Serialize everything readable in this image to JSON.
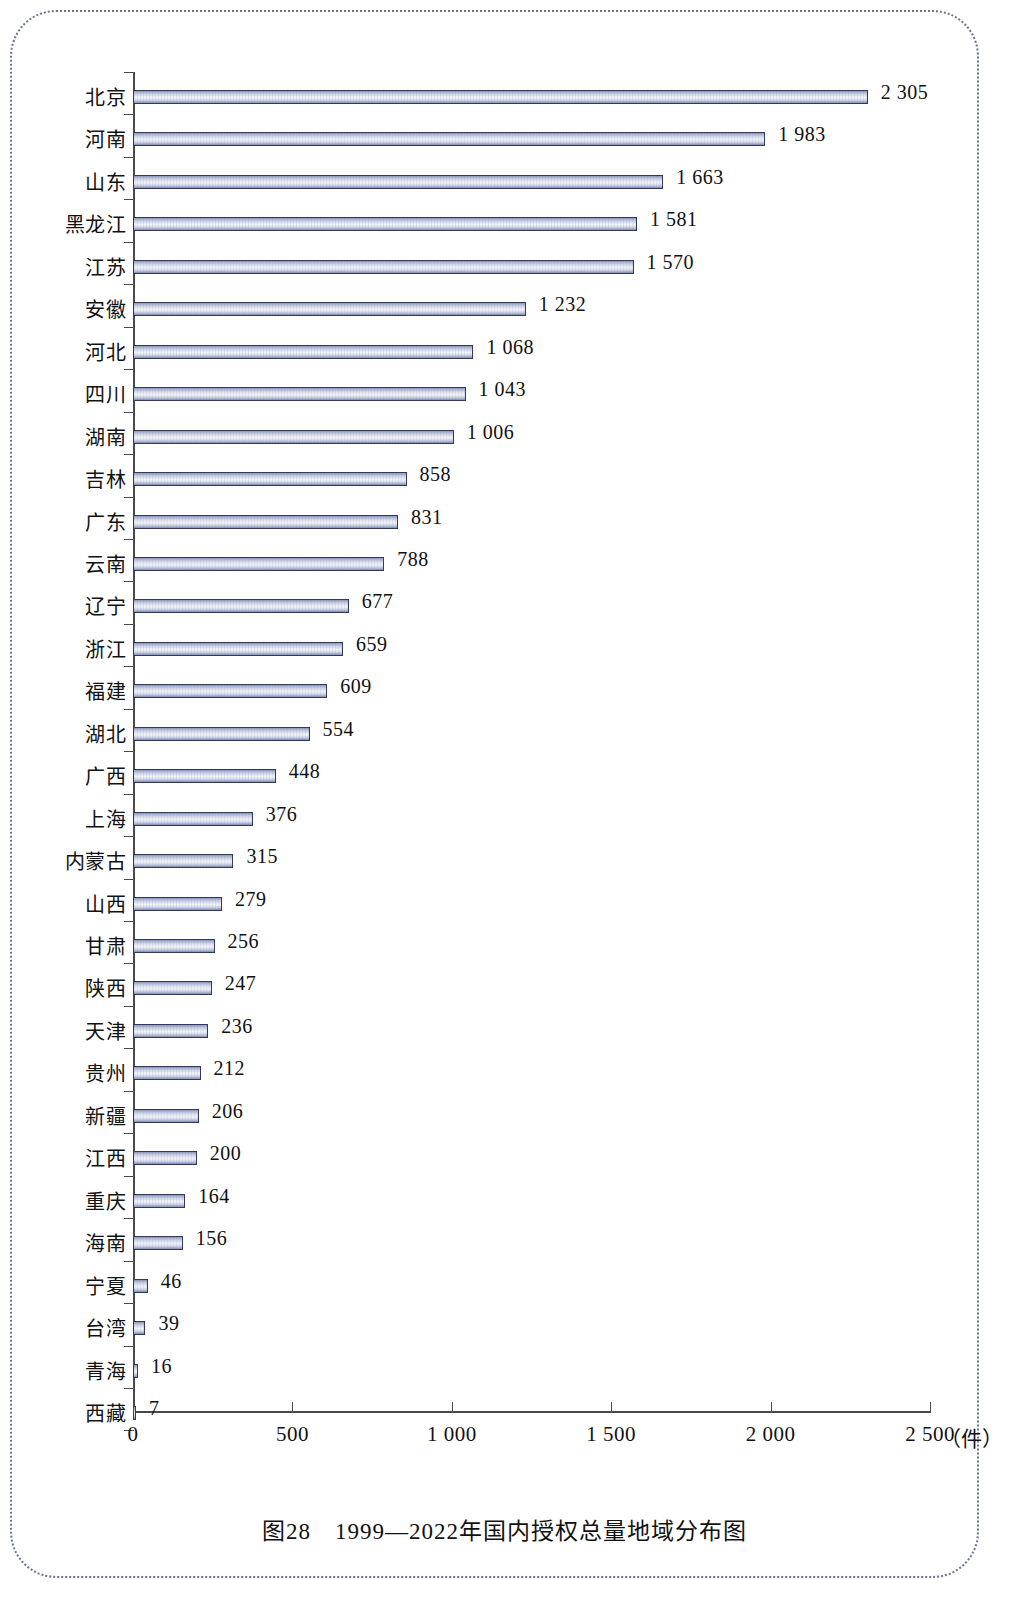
{
  "figure": {
    "caption": "图28　1999—2022年国内授权总量地域分布图",
    "unit_label": "（件）"
  },
  "chart_data": {
    "type": "bar",
    "orientation": "horizontal",
    "title": "图28　1999—2022年国内授权总量地域分布图",
    "xlabel": "（件）",
    "ylabel": "",
    "xlim": [
      0,
      2500
    ],
    "grid": false,
    "legend": null,
    "xticks": [
      0,
      500,
      1000,
      1500,
      2000,
      2500
    ],
    "xtick_labels": [
      "0",
      "500",
      "1 000",
      "1 500",
      "2 000",
      "2 500"
    ],
    "categories": [
      "北京",
      "河南",
      "山东",
      "黑龙江",
      "江苏",
      "安徽",
      "河北",
      "四川",
      "湖南",
      "吉林",
      "广东",
      "云南",
      "辽宁",
      "浙江",
      "福建",
      "湖北",
      "广西",
      "上海",
      "内蒙古",
      "山西",
      "甘肃",
      "陕西",
      "天津",
      "贵州",
      "新疆",
      "江西",
      "重庆",
      "海南",
      "宁夏",
      "台湾",
      "青海",
      "西藏"
    ],
    "values": [
      2305,
      1983,
      1663,
      1581,
      1570,
      1232,
      1068,
      1043,
      1006,
      858,
      831,
      788,
      677,
      659,
      609,
      554,
      448,
      376,
      315,
      279,
      256,
      247,
      236,
      212,
      206,
      200,
      164,
      156,
      46,
      39,
      16,
      7
    ],
    "value_labels": [
      "2 305",
      "1 983",
      "1 663",
      "1 581",
      "1 570",
      "1 232",
      "1 068",
      "1 043",
      "1 006",
      "858",
      "831",
      "788",
      "677",
      "659",
      "609",
      "554",
      "448",
      "376",
      "315",
      "279",
      "256",
      "247",
      "236",
      "212",
      "206",
      "200",
      "164",
      "156",
      "46",
      "39",
      "16",
      "7"
    ],
    "colors": {
      "bar_border": "#313a5e",
      "bar_fill_light": "#f2f4fa",
      "bar_fill_dark": "#7f88ac",
      "axis": "#4a4a4a",
      "text": "#111111",
      "frame": "#6b7390"
    }
  }
}
